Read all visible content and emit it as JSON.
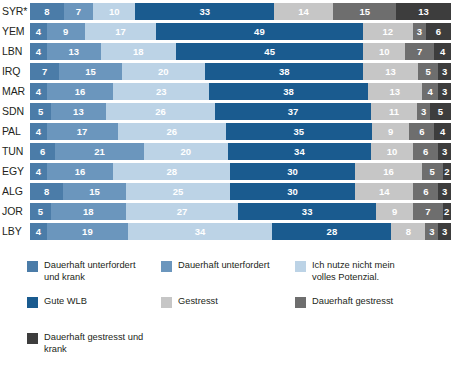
{
  "chart_data": {
    "type": "bar",
    "orientation": "horizontal",
    "stacked": true,
    "normalized": "percent",
    "title": "",
    "subtitle": "",
    "xlabel": "",
    "ylabel": "",
    "xlim": [
      0,
      100
    ],
    "grid": false,
    "legend_position": "bottom-left",
    "categories": [
      "SYR*",
      "YEM",
      "LBN",
      "IRQ",
      "MAR",
      "SDN",
      "PAL",
      "TUN",
      "EGY",
      "ALG",
      "JOR",
      "LBY"
    ],
    "series": [
      {
        "name": "Dauerhaft unterfordert und krank",
        "color": "#4b7ca8",
        "values": [
          8,
          4,
          4,
          7,
          4,
          5,
          4,
          6,
          4,
          8,
          5,
          4
        ]
      },
      {
        "name": "Dauerhaft unterfordert",
        "color": "#6b96bd",
        "values": [
          7,
          9,
          13,
          15,
          16,
          13,
          17,
          21,
          16,
          15,
          18,
          19
        ]
      },
      {
        "name": "Ich nutze nicht mein volles Potenzial.",
        "color": "#bcd3e6",
        "values": [
          10,
          17,
          18,
          20,
          23,
          26,
          26,
          20,
          28,
          25,
          27,
          34
        ]
      },
      {
        "name": "Gute WLB",
        "color": "#1a5b8f",
        "values": [
          33,
          49,
          45,
          38,
          38,
          37,
          35,
          34,
          30,
          30,
          33,
          28
        ]
      },
      {
        "name": "Gestresst",
        "color": "#c6c6c6",
        "values": [
          14,
          12,
          10,
          13,
          13,
          11,
          9,
          10,
          16,
          14,
          9,
          8
        ]
      },
      {
        "name": "Dauerhaft gestresst",
        "color": "#6e6e6e",
        "values": [
          15,
          3,
          7,
          5,
          4,
          3,
          6,
          6,
          5,
          6,
          7,
          3
        ]
      },
      {
        "name": "Dauerhaft gestresst und krank",
        "color": "#3d3d3d",
        "values": [
          13,
          6,
          4,
          3,
          3,
          5,
          4,
          3,
          2,
          3,
          2,
          3
        ]
      }
    ]
  },
  "legend": {
    "items": [
      {
        "label": "Dauerhaft unterfordert\nund krank",
        "color": "#4b7ca8"
      },
      {
        "label": "Dauerhaft unterfordert",
        "color": "#6b96bd"
      },
      {
        "label": "Ich nutze nicht mein\nvolles Potenzial.",
        "color": "#bcd3e6"
      },
      {
        "label": "Gute WLB",
        "color": "#1a5b8f"
      },
      {
        "label": "Gestresst",
        "color": "#c6c6c6"
      },
      {
        "label": "Dauerhaft gestresst",
        "color": "#6e6e6e"
      },
      {
        "label": "Dauerhaft gestresst und\nkrank",
        "color": "#3d3d3d"
      }
    ]
  },
  "style": {
    "background": "#ffffff",
    "label_color": "#231f20",
    "value_color": "#ffffff",
    "row_gap_color": "#ffffff"
  }
}
